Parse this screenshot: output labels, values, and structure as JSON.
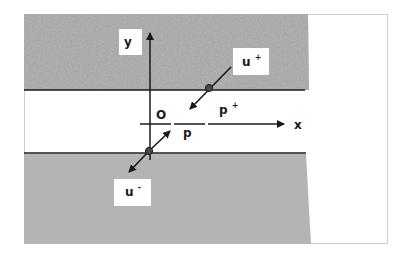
{
  "diagram": {
    "type": "interface-crack-schematic",
    "frame": {
      "x": 24,
      "y": 14,
      "width": 364,
      "height": 230,
      "border_color": "#c8c8c8"
    },
    "regions": [
      {
        "name": "upper-material",
        "fill": "textured-gray",
        "y_top": 14,
        "y_bottom": 90
      },
      {
        "name": "interlayer",
        "fill": "#ffffff",
        "y_top": 90,
        "y_bottom": 153
      },
      {
        "name": "lower-material",
        "fill": "#b4b4b4",
        "y_top": 153,
        "y_bottom": 244
      }
    ],
    "axes": {
      "x_label": "x",
      "y_label": "y",
      "origin_label": "O"
    },
    "points": {
      "p": "p",
      "p_plus_base": "p",
      "p_plus_sup": "+"
    },
    "displacements": {
      "u_plus_base": "u",
      "u_plus_sup": "+",
      "u_minus_base": "u",
      "u_minus_sup": "-"
    },
    "colors": {
      "line": "#1a1a1a",
      "upper_texture_base": "#9a9a9a",
      "lower_fill": "#b4b4b4",
      "label_box": "#ffffff"
    }
  }
}
